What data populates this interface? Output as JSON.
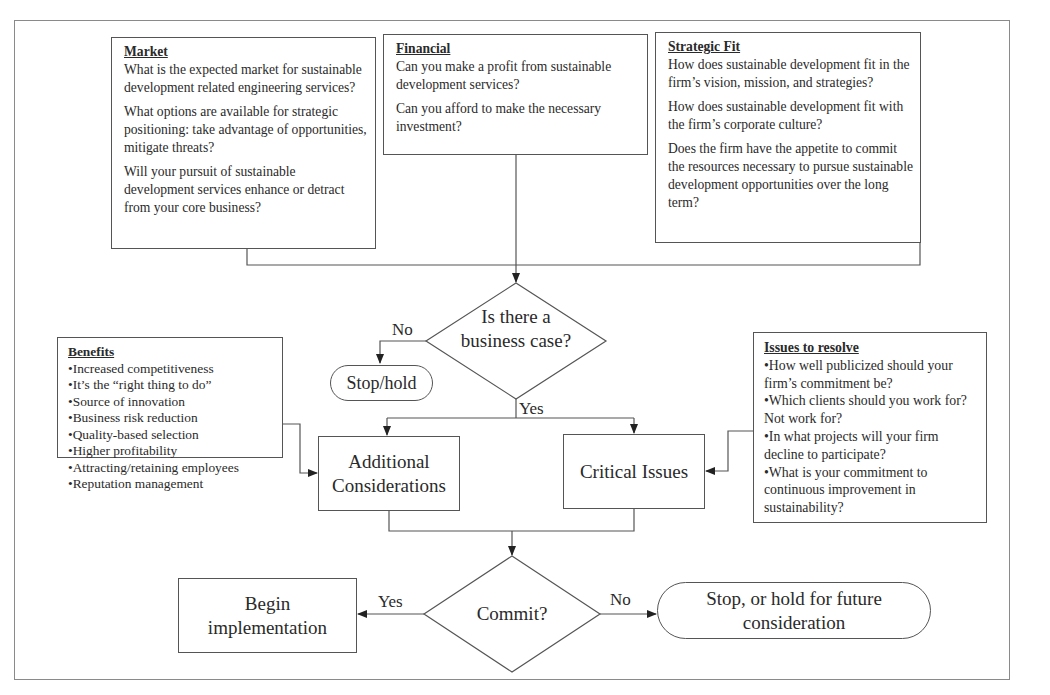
{
  "diagram": {
    "market": {
      "title": "Market",
      "questions": [
        "What is the expected market for sustainable development related engineering services?",
        "What options are available for strategic positioning:  take advantage of opportunities, mitigate threats?",
        "Will your pursuit of sustainable development services enhance or detract from your core business?"
      ]
    },
    "financial": {
      "title": "Financial",
      "questions": [
        "Can you make a profit from sustainable development services?",
        "Can you afford to make the necessary investment?"
      ]
    },
    "strategic_fit": {
      "title": "Strategic Fit",
      "questions": [
        "How does sustainable development fit in the firm’s vision, mission, and strategies?",
        "How does sustainable development fit with the firm’s corporate culture?",
        "Does the firm have the appetite to commit the resources necessary to pursue sustainable development opportunities over the long term?"
      ]
    },
    "decision_business_case": {
      "label": "Is there a business case?",
      "no_label": "No",
      "yes_label": "Yes"
    },
    "stop_hold": {
      "label": "Stop/hold"
    },
    "benefits": {
      "title": "Benefits",
      "items": [
        "•Increased competitiveness",
        "•It’s the “right thing to do”",
        "•Source of innovation",
        "•Business risk reduction",
        "•Quality-based selection",
        "•Higher profitability",
        "•Attracting/retaining employees",
        "•Reputation management"
      ]
    },
    "additional_considerations": {
      "label": "Additional Considerations"
    },
    "critical_issues": {
      "label": "Critical Issues"
    },
    "issues_to_resolve": {
      "title": "Issues to resolve",
      "items": [
        "•How well publicized should your firm’s commitment be?",
        "•Which clients should you work for?  Not work for?",
        "•In what projects will your firm decline to participate?",
        "•What is your commitment to continuous improvement in sustainability?"
      ]
    },
    "decision_commit": {
      "label": "Commit?",
      "yes_label": "Yes",
      "no_label": "No"
    },
    "begin_implementation": {
      "label": "Begin implementation"
    },
    "stop_future": {
      "label": "Stop, or hold for future consideration"
    },
    "colors": {
      "stroke": "#555555",
      "frame": "#8a8a8a",
      "text": "#2a2a2a"
    }
  }
}
